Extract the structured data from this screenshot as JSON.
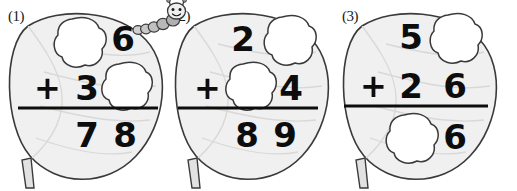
{
  "worksheet": {
    "title": "Leaf addition puzzles with missing digits",
    "background_color": "#ffffff",
    "ink_color": "#0d0d0d",
    "leaf_fill_color": "#f0f0f0",
    "leaf_outline_color": "#3a3a3a",
    "hole_fill_color": "#ffffff"
  },
  "decorations": {
    "caterpillar": {
      "name": "caterpillar",
      "segment_count": 6,
      "has_antennae": true,
      "has_smile": true
    }
  },
  "problems": [
    {
      "label": "(1)",
      "operator": "+",
      "addend_top": {
        "tens": "",
        "ones": "6",
        "tens_is_hole": true,
        "ones_is_hole": false
      },
      "addend_bottom": {
        "tens": "3",
        "ones": "",
        "tens_is_hole": false,
        "ones_is_hole": true
      },
      "sum": {
        "tens": "7",
        "ones": "8",
        "tens_is_hole": false,
        "ones_is_hole": false
      }
    },
    {
      "label": "(2)",
      "operator": "+",
      "addend_top": {
        "tens": "2",
        "ones": "",
        "tens_is_hole": false,
        "ones_is_hole": true
      },
      "addend_bottom": {
        "tens": "",
        "ones": "4",
        "tens_is_hole": true,
        "ones_is_hole": false
      },
      "sum": {
        "tens": "8",
        "ones": "9",
        "tens_is_hole": false,
        "ones_is_hole": false
      }
    },
    {
      "label": "(3)",
      "operator": "+",
      "addend_top": {
        "tens": "5",
        "ones": "",
        "tens_is_hole": false,
        "ones_is_hole": true
      },
      "addend_bottom": {
        "tens": "2",
        "ones": "6",
        "tens_is_hole": false,
        "ones_is_hole": false
      },
      "sum": {
        "tens": "",
        "ones": "6",
        "tens_is_hole": true,
        "ones_is_hole": false
      }
    }
  ]
}
